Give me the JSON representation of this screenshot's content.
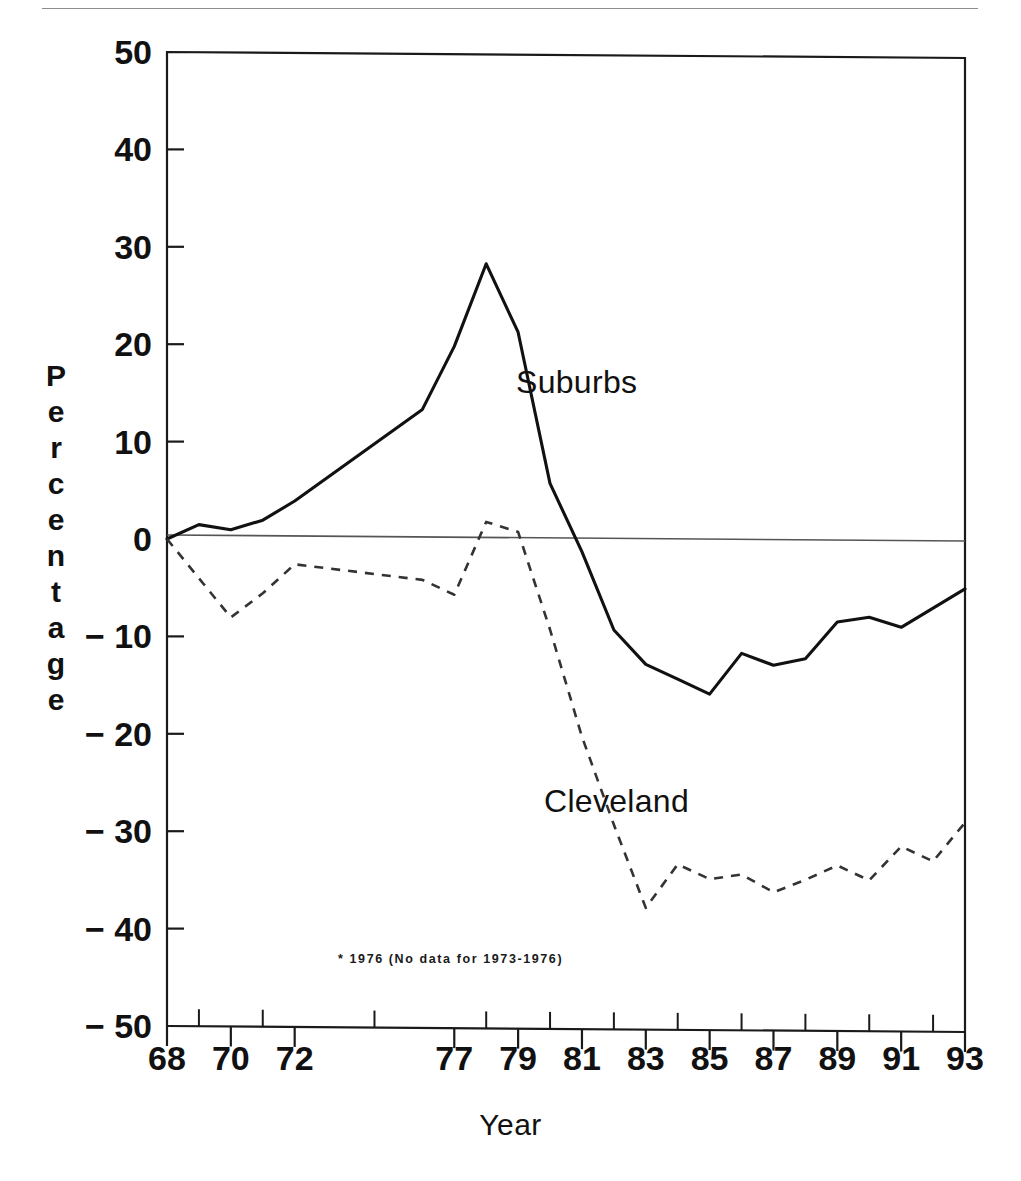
{
  "figure": {
    "x_axis_title": "Year",
    "y_axis_title": "Percentage",
    "footnote": "* 1976 (No data for 1973-1976)",
    "series_labels": {
      "suburbs": "Suburbs",
      "cleveland": "Cleveland"
    },
    "colors": {
      "ink": "#111111",
      "rule": "#8d8d8d",
      "axis": "#1a1a1a",
      "zero_line": "#555555",
      "background": "#ffffff"
    }
  },
  "chart_data": {
    "type": "line",
    "title": "",
    "subtitle": "",
    "xlabel": "Year",
    "ylabel": "Percentage",
    "xlim": [
      1968,
      1993
    ],
    "ylim": [
      -50,
      50
    ],
    "grid": false,
    "legend_position": "in-plot annotations",
    "note": "* 1976 (No data for 1973-1976)",
    "y_ticks": [
      50,
      40,
      30,
      20,
      10,
      0,
      -10,
      -20,
      -30,
      -40,
      -50
    ],
    "y_tick_labels": [
      "50",
      "40",
      "30",
      "20",
      "10",
      "0",
      "-10",
      "-20",
      "-30",
      "-40",
      "-50"
    ],
    "x_ticks": [
      1968,
      1970,
      1972,
      1977,
      1979,
      1981,
      1983,
      1985,
      1987,
      1989,
      1991,
      1993
    ],
    "x_tick_labels": [
      "68",
      "70",
      "72",
      "77",
      "79",
      "81",
      "83",
      "85",
      "87",
      "89",
      "91",
      "93"
    ],
    "x": [
      1968,
      1969,
      1970,
      1971,
      1972,
      1976,
      1977,
      1978,
      1979,
      1980,
      1981,
      1982,
      1983,
      1984,
      1985,
      1986,
      1987,
      1988,
      1989,
      1990,
      1991,
      1992,
      1993
    ],
    "series": [
      {
        "name": "Suburbs",
        "style": "solid",
        "values": [
          0.0,
          1.5,
          1.0,
          2.0,
          4.0,
          13.5,
          20.0,
          28.5,
          21.5,
          6.0,
          -1.0,
          -9.0,
          -12.5,
          -14.0,
          -15.5,
          -11.3,
          -12.5,
          -11.8,
          -8.0,
          -7.5,
          -8.5,
          -6.5,
          -4.5
        ]
      },
      {
        "name": "Cleveland",
        "style": "dashed",
        "values": [
          0.0,
          -4.0,
          -8.0,
          -5.5,
          -2.5,
          -4.0,
          -5.5,
          2.0,
          1.0,
          -9.0,
          -20.0,
          -29.0,
          -37.5,
          -33.0,
          -34.5,
          -34.0,
          -35.8,
          -34.5,
          -33.0,
          -34.5,
          -31.0,
          -32.5,
          -28.5
        ]
      }
    ]
  }
}
